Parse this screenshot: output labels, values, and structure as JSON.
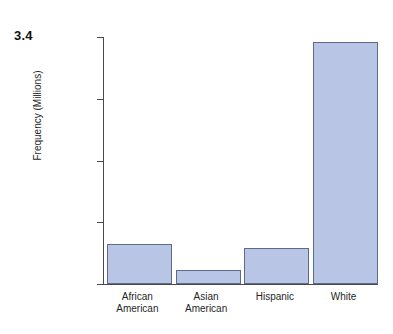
{
  "figure": {
    "number_label": "3.4"
  },
  "chart_data": {
    "type": "bar",
    "title": "",
    "xlabel": "",
    "ylabel": "Frequency (Millions)",
    "categories": [
      "African American",
      "Asian American",
      "Hispanic",
      "White"
    ],
    "category_lines": [
      [
        "African",
        "American"
      ],
      [
        "Asian",
        "American"
      ],
      [
        "Hispanic"
      ],
      [
        "White"
      ]
    ],
    "values": [
      32,
      11,
      29,
      196
    ],
    "ylim": [
      0,
      200
    ],
    "yticks": [
      0,
      50,
      100,
      150,
      200
    ],
    "ytick_labels": [
      "0",
      "50",
      "100",
      "150",
      "200"
    ],
    "grid": false,
    "legend": false,
    "bar_fill_color": "#b9c5e4",
    "bar_edge_color": "#5d6a8c",
    "axis_color": "#4a4a4a"
  }
}
